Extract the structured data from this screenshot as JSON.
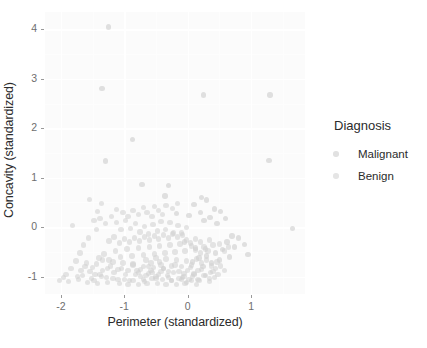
{
  "chart_data": {
    "type": "scatter",
    "title": "",
    "xlabel": "Perimeter (standardized)",
    "ylabel": "Concavity (standardized)",
    "xlim": [
      -2.25,
      1.85
    ],
    "ylim": [
      -1.35,
      4.35
    ],
    "xticks": [
      -2,
      -1,
      0,
      1
    ],
    "xticklabels": [
      "-2",
      "-1",
      "0",
      "1"
    ],
    "yticks": [
      -1,
      0,
      1,
      2,
      3,
      4
    ],
    "yticklabels": [
      "-1",
      "0",
      "1",
      "2",
      "3",
      "4"
    ],
    "grid": true,
    "grid_color": "#ffffff",
    "panel_background": "#fbfbfb",
    "legend": {
      "title": "Diagnosis",
      "position": "right",
      "entries": [
        {
          "label": "Malignant",
          "color": "#c9c9c9"
        },
        {
          "label": "Benign",
          "color": "#cfcfcf"
        }
      ]
    },
    "point_color": "#b4b4b4",
    "point_opacity": 0.55,
    "point_size": 5.4,
    "series": [
      {
        "name": "Malignant",
        "color": "#c9c9c9",
        "points": [
          [
            -1.25,
            4.05
          ],
          [
            -1.35,
            2.81
          ],
          [
            0.25,
            2.67
          ],
          [
            1.3,
            2.67
          ],
          [
            -0.87,
            1.77
          ],
          [
            1.28,
            1.35
          ],
          [
            -1.3,
            1.34
          ],
          [
            -0.72,
            0.86
          ],
          [
            -0.3,
            0.84
          ],
          [
            -0.36,
            0.63
          ],
          [
            0.22,
            0.6
          ],
          [
            0.3,
            0.55
          ],
          [
            0.1,
            0.46
          ],
          [
            0.42,
            0.37
          ],
          [
            0.52,
            0.32
          ],
          [
            0.2,
            0.3
          ],
          [
            -0.18,
            0.28
          ],
          [
            0.02,
            0.24
          ],
          [
            0.35,
            0.2
          ],
          [
            0.6,
            0.18
          ],
          [
            0.26,
            0.13
          ],
          [
            0.46,
            0.08
          ],
          [
            1.65,
            -0.02
          ],
          [
            0.7,
            -0.18
          ],
          [
            0.8,
            -0.22
          ],
          [
            0.62,
            -0.3
          ],
          [
            0.9,
            -0.35
          ],
          [
            0.74,
            -0.4
          ],
          [
            0.95,
            -0.55
          ],
          [
            0.55,
            -0.45
          ],
          [
            0.44,
            -0.52
          ],
          [
            0.3,
            -0.58
          ],
          [
            0.18,
            -0.62
          ],
          [
            0.66,
            -0.6
          ],
          [
            0.08,
            -0.7
          ],
          [
            0.38,
            -0.72
          ],
          [
            -0.05,
            -0.3
          ],
          [
            0.12,
            -0.42
          ],
          [
            0.5,
            -0.66
          ],
          [
            0.24,
            -0.8
          ]
        ]
      },
      {
        "name": "Benign",
        "color": "#cfcfcf",
        "points": [
          [
            -1.55,
            0.56
          ],
          [
            -1.82,
            0.04
          ],
          [
            -1.42,
            0.32
          ],
          [
            -1.38,
            0.18
          ],
          [
            -1.3,
            0.08
          ],
          [
            -1.44,
            -0.04
          ],
          [
            -1.2,
            0.22
          ],
          [
            -1.12,
            0.1
          ],
          [
            -1.05,
            -0.05
          ],
          [
            -0.98,
            0.14
          ],
          [
            -0.9,
            -0.02
          ],
          [
            -0.82,
            0.08
          ],
          [
            -0.75,
            -0.1
          ],
          [
            -0.68,
            0.02
          ],
          [
            -0.62,
            -0.14
          ],
          [
            -0.55,
            0.06
          ],
          [
            -0.48,
            -0.08
          ],
          [
            -0.42,
            0.12
          ],
          [
            -0.35,
            -0.04
          ],
          [
            -0.28,
            0.1
          ],
          [
            -0.22,
            -0.12
          ],
          [
            -0.15,
            0.04
          ],
          [
            -0.08,
            -0.16
          ],
          [
            -0.02,
            0.0
          ],
          [
            -1.6,
            -0.72
          ],
          [
            -1.5,
            -0.82
          ],
          [
            -1.46,
            -0.95
          ],
          [
            -1.34,
            -0.88
          ],
          [
            -1.28,
            -1.02
          ],
          [
            -1.22,
            -0.78
          ],
          [
            -1.16,
            -0.92
          ],
          [
            -1.1,
            -1.06
          ],
          [
            -1.04,
            -0.84
          ],
          [
            -0.98,
            -0.96
          ],
          [
            -0.92,
            -1.08
          ],
          [
            -0.86,
            -0.74
          ],
          [
            -0.8,
            -0.88
          ],
          [
            -0.74,
            -1.0
          ],
          [
            -0.68,
            -1.1
          ],
          [
            -0.62,
            -0.8
          ],
          [
            -0.56,
            -0.92
          ],
          [
            -0.5,
            -1.04
          ],
          [
            -0.44,
            -0.7
          ],
          [
            -0.38,
            -0.84
          ],
          [
            -0.32,
            -0.98
          ],
          [
            -0.26,
            -1.08
          ],
          [
            -0.2,
            -0.76
          ],
          [
            -0.14,
            -0.9
          ],
          [
            -0.08,
            -1.02
          ],
          [
            -0.02,
            -1.12
          ],
          [
            0.04,
            -0.82
          ],
          [
            0.1,
            -0.94
          ],
          [
            0.16,
            -1.06
          ],
          [
            0.22,
            -0.86
          ],
          [
            0.28,
            -0.98
          ],
          [
            0.34,
            -1.1
          ],
          [
            0.4,
            -0.9
          ],
          [
            -2.02,
            -1.08
          ],
          [
            -1.88,
            -1.1
          ],
          [
            -1.72,
            -1.06
          ],
          [
            -1.66,
            -0.98
          ],
          [
            -1.58,
            -1.12
          ],
          [
            -1.52,
            -1.04
          ],
          [
            -1.42,
            -1.14
          ],
          [
            -1.36,
            -1.0
          ],
          [
            -1.26,
            -1.12
          ],
          [
            -1.18,
            -1.04
          ],
          [
            -1.08,
            -1.14
          ],
          [
            -1.0,
            -1.06
          ],
          [
            -0.94,
            -1.16
          ],
          [
            -0.86,
            -1.08
          ],
          [
            -0.78,
            -1.16
          ],
          [
            -0.7,
            -1.06
          ],
          [
            -0.64,
            -1.14
          ],
          [
            -0.56,
            -1.04
          ],
          [
            -0.48,
            -1.14
          ],
          [
            -0.4,
            -1.06
          ],
          [
            -0.34,
            -1.16
          ],
          [
            -0.26,
            -1.08
          ],
          [
            -0.18,
            -1.16
          ],
          [
            -0.1,
            -1.06
          ],
          [
            -0.04,
            -1.14
          ],
          [
            0.06,
            -1.08
          ],
          [
            0.14,
            -1.16
          ],
          [
            -1.4,
            -0.62
          ],
          [
            -1.32,
            -0.54
          ],
          [
            -1.24,
            -0.66
          ],
          [
            -1.14,
            -0.48
          ],
          [
            -1.06,
            -0.6
          ],
          [
            -0.96,
            -0.44
          ],
          [
            -0.88,
            -0.58
          ],
          [
            -0.78,
            -0.42
          ],
          [
            -0.7,
            -0.56
          ],
          [
            -0.6,
            -0.4
          ],
          [
            -0.52,
            -0.54
          ],
          [
            -0.44,
            -0.38
          ],
          [
            -0.36,
            -0.52
          ],
          [
            -0.28,
            -0.36
          ],
          [
            -0.2,
            -0.5
          ],
          [
            -0.12,
            -0.34
          ],
          [
            -0.04,
            -0.48
          ],
          [
            0.04,
            -0.32
          ],
          [
            0.12,
            -0.46
          ],
          [
            0.2,
            -0.3
          ],
          [
            0.28,
            -0.44
          ],
          [
            -1.24,
            -0.28
          ],
          [
            -1.16,
            -0.2
          ],
          [
            -1.08,
            -0.32
          ],
          [
            -1.0,
            -0.24
          ],
          [
            -0.92,
            -0.3
          ],
          [
            -0.84,
            -0.22
          ],
          [
            -0.76,
            -0.28
          ],
          [
            -0.68,
            -0.2
          ],
          [
            -0.6,
            -0.26
          ],
          [
            -0.52,
            -0.18
          ],
          [
            -0.46,
            -0.24
          ],
          [
            -0.38,
            -0.16
          ],
          [
            -0.3,
            -0.22
          ],
          [
            -0.24,
            -0.14
          ],
          [
            -0.16,
            -0.2
          ],
          [
            -0.1,
            -0.12
          ],
          [
            -0.56,
            0.22
          ],
          [
            -0.64,
            0.3
          ],
          [
            -0.46,
            0.34
          ],
          [
            -0.4,
            0.26
          ],
          [
            -0.52,
            0.42
          ],
          [
            -0.34,
            0.44
          ],
          [
            -0.24,
            0.38
          ],
          [
            -0.16,
            0.48
          ],
          [
            -0.7,
            0.4
          ],
          [
            -0.78,
            0.26
          ],
          [
            -0.86,
            0.34
          ],
          [
            -0.94,
            0.22
          ],
          [
            -1.02,
            0.3
          ],
          [
            -1.12,
            0.36
          ],
          [
            -1.36,
            0.48
          ],
          [
            -1.48,
            0.14
          ],
          [
            -1.56,
            -0.22
          ],
          [
            -1.64,
            -0.36
          ],
          [
            -1.7,
            -0.52
          ],
          [
            -1.76,
            -0.68
          ],
          [
            -1.84,
            -0.84
          ],
          [
            -1.92,
            -0.96
          ],
          [
            -1.96,
            -1.02
          ],
          [
            -0.66,
            -0.66
          ],
          [
            -0.58,
            -0.72
          ],
          [
            -0.5,
            -0.62
          ],
          [
            -0.42,
            -0.76
          ],
          [
            -0.34,
            -0.64
          ],
          [
            -0.26,
            -0.78
          ],
          [
            -0.18,
            -0.66
          ],
          [
            -0.1,
            -0.8
          ],
          [
            -0.02,
            -0.68
          ],
          [
            0.06,
            -0.76
          ],
          [
            0.14,
            -0.64
          ],
          [
            0.22,
            -0.72
          ],
          [
            0.3,
            -0.66
          ],
          [
            0.38,
            -0.78
          ],
          [
            0.46,
            -0.7
          ],
          [
            -0.82,
            -0.96
          ],
          [
            -0.74,
            -0.86
          ],
          [
            -0.66,
            -0.98
          ],
          [
            -0.58,
            -0.88
          ],
          [
            -0.5,
            -1.0
          ],
          [
            -0.42,
            -0.9
          ],
          [
            -0.3,
            -1.02
          ],
          [
            -0.22,
            -0.92
          ],
          [
            -0.14,
            -1.04
          ],
          [
            -0.06,
            -0.94
          ],
          [
            0.02,
            -1.06
          ],
          [
            0.1,
            -0.96
          ],
          [
            0.18,
            -1.08
          ],
          [
            0.26,
            -0.98
          ],
          [
            0.34,
            -1.04
          ],
          [
            -1.44,
            -0.74
          ],
          [
            -1.34,
            -0.66
          ],
          [
            -1.26,
            -0.84
          ],
          [
            -1.18,
            -0.7
          ],
          [
            -1.1,
            -0.86
          ],
          [
            -1.02,
            -0.72
          ],
          [
            -0.94,
            -0.88
          ],
          [
            -0.86,
            -0.76
          ],
          [
            -0.78,
            -0.92
          ],
          [
            -0.7,
            -0.8
          ],
          [
            -0.62,
            -0.94
          ],
          [
            -0.54,
            -0.82
          ],
          [
            -0.46,
            -0.96
          ],
          [
            -0.38,
            -0.84
          ],
          [
            -0.3,
            -0.9
          ],
          [
            0.44,
            -0.84
          ],
          [
            0.52,
            -0.78
          ],
          [
            0.58,
            -0.88
          ],
          [
            0.48,
            -0.96
          ],
          [
            0.36,
            -0.92
          ],
          [
            0.42,
            -1.02
          ],
          [
            0.16,
            -0.88
          ],
          [
            0.08,
            -1.0
          ],
          [
            0.0,
            -0.88
          ],
          [
            -0.06,
            -1.0
          ],
          [
            0.2,
            -0.52
          ],
          [
            0.26,
            -0.4
          ],
          [
            0.32,
            -0.48
          ],
          [
            0.4,
            -0.36
          ],
          [
            0.12,
            -0.24
          ],
          [
            0.06,
            -0.38
          ],
          [
            -0.02,
            -0.26
          ],
          [
            0.34,
            -0.26
          ],
          [
            0.5,
            -0.34
          ],
          [
            0.58,
            -0.48
          ],
          [
            0.64,
            -0.4
          ],
          [
            -1.68,
            -0.88
          ],
          [
            -1.74,
            -1.0
          ],
          [
            -1.62,
            -0.8
          ],
          [
            -1.54,
            -0.9
          ],
          [
            -1.48,
            -1.08
          ],
          [
            -1.38,
            -0.96
          ]
        ]
      }
    ]
  }
}
